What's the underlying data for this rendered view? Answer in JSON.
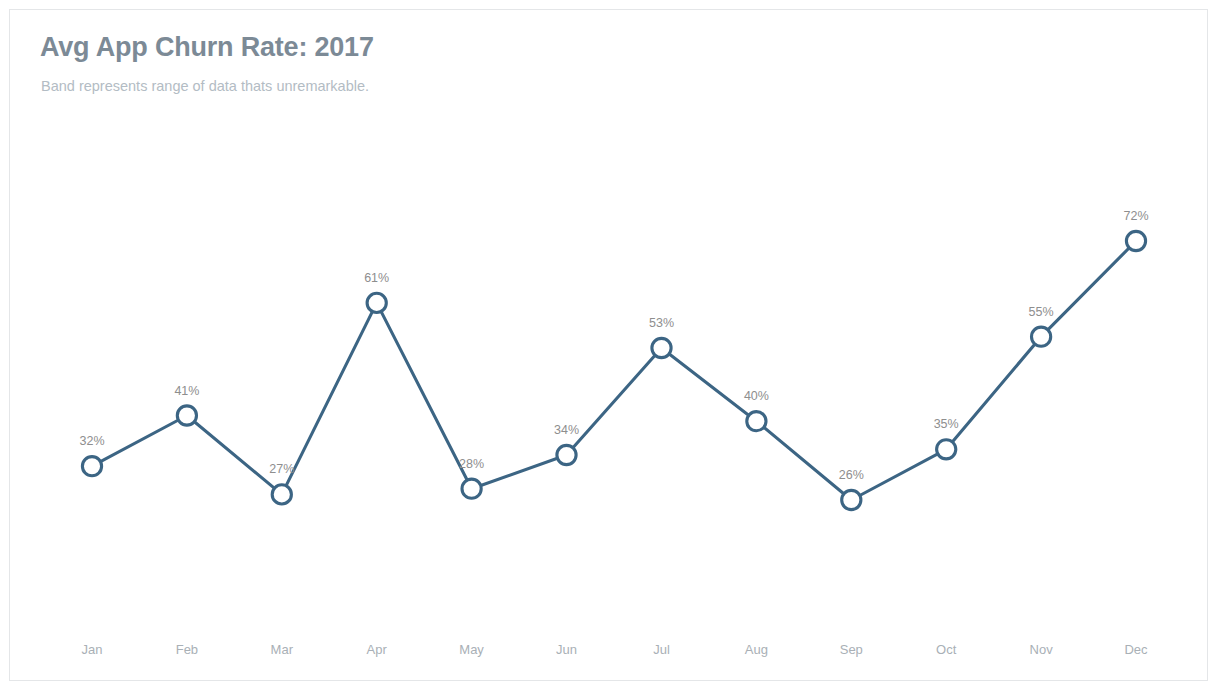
{
  "card": {
    "title": "Avg App Churn Rate: 2017",
    "subtitle": "Band represents range of data thats unremarkable."
  },
  "style": {
    "line_color": "#3c6584",
    "marker_stroke": "#3c6584",
    "marker_fill": "#ffffff",
    "label_color": "#8e8e8e",
    "axis_label_color": "#a9b0b6",
    "title_color": "#7c8a96",
    "subtitle_color": "#b3bcc4",
    "background": "#ffffff",
    "border_color": "#e4e6e8"
  },
  "chart_data": {
    "type": "line",
    "title": "Avg App Churn Rate: 2017",
    "subtitle": "Band represents range of data thats unremarkable.",
    "xlabel": "",
    "ylabel": "",
    "grid": false,
    "legend": "none",
    "ylim": [
      20,
      76
    ],
    "value_suffix": "%",
    "categories": [
      "Jan",
      "Feb",
      "Mar",
      "Apr",
      "May",
      "Jun",
      "Jul",
      "Aug",
      "Sep",
      "Oct",
      "Nov",
      "Dec"
    ],
    "values": [
      32,
      41,
      27,
      61,
      28,
      34,
      53,
      40,
      26,
      35,
      55,
      72
    ],
    "point_labels": [
      "32%",
      "41%",
      "27%",
      "61%",
      "28%",
      "34%",
      "53%",
      "40%",
      "26%",
      "35%",
      "55%",
      "72%"
    ],
    "marker": "open-circle"
  }
}
